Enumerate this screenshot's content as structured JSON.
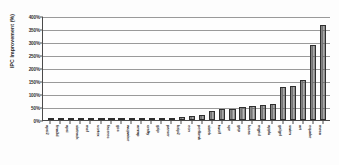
{
  "chart_data": {
    "type": "bar",
    "title": "",
    "xlabel": "",
    "ylabel": "IPC Improvement (%)",
    "ylim": [
      0,
      400
    ],
    "ytick_labels": [
      "400%",
      "350%",
      "300%",
      "250%",
      "200%",
      "150%",
      "100%",
      "50%",
      "0%"
    ],
    "ytick_values": [
      400,
      350,
      300,
      250,
      200,
      150,
      100,
      50,
      0
    ],
    "grid": true,
    "legend": null,
    "bar_color": "#6f6f6f",
    "bar_edge_color": "#2f2f2f",
    "axis_color": "#4a4a4a",
    "gridline_color": "#9a9a9a",
    "categories": [
      "fma3d",
      "apsi",
      "sixtrack",
      "mcf",
      "vortex",
      "facerec",
      "gcc",
      "wupwise",
      "ammp",
      "crafty",
      "gzip",
      "parser",
      "bzip2",
      "eon",
      "perlbmk",
      "sixtrk",
      "twolf",
      "vpr",
      "gap",
      "lucas",
      "mgrid",
      "applu",
      "galgel",
      "swim",
      "art",
      "equake",
      "mesa",
      "apsi2"
    ],
    "values": [
      0.5,
      0.8,
      1.2,
      1.8,
      2.2,
      3.0,
      3.5,
      4.0,
      4.5,
      5.5,
      7.0,
      8.5,
      11.0,
      14.0,
      19.0,
      36.0,
      41.0,
      42.0,
      50.0,
      53.0,
      59.0,
      61.0,
      127.0,
      131.0,
      153.0,
      290.0,
      365.0,
      0.3
    ]
  }
}
